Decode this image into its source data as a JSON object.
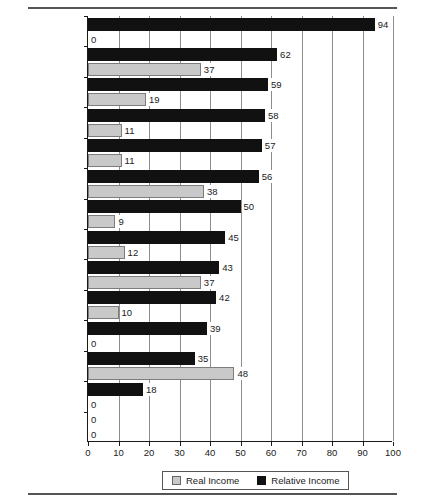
{
  "chart_data": {
    "type": "bar",
    "orientation": "horizontal",
    "title": "",
    "xlabel": "",
    "ylabel": "",
    "xlim": [
      0,
      100
    ],
    "xticks": [
      0,
      10,
      20,
      30,
      40,
      50,
      60,
      70,
      80,
      90,
      100
    ],
    "grid": true,
    "legend_position": "bottom",
    "categories": [
      "United Kingdom",
      "Denmark",
      "Sweden",
      "Belgium",
      "Finland",
      "Norway",
      "France",
      "Netherlands",
      "Canada",
      "Germany",
      "Australia",
      "Switzerland",
      "Spain",
      "Italy"
    ],
    "series": [
      {
        "name": "Relative Income",
        "color": "#111111",
        "values": [
          94,
          62,
          59,
          58,
          57,
          56,
          50,
          45,
          43,
          42,
          39,
          35,
          18,
          0
        ]
      },
      {
        "name": "Real Income",
        "color": "#c9c9c9",
        "values": [
          0,
          37,
          19,
          11,
          11,
          38,
          9,
          12,
          37,
          10,
          0,
          48,
          0,
          0
        ]
      }
    ]
  },
  "legend": {
    "items": [
      {
        "label": "Real Income",
        "swatch": "light-gray-square"
      },
      {
        "label": "Relative Income",
        "swatch": "black-square"
      }
    ]
  }
}
